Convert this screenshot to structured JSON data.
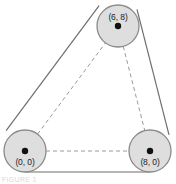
{
  "figure": {
    "name": "three-pulley-belt-diagram",
    "background_color": "#ffffff",
    "width": 176,
    "height": 184,
    "circle_fill": "#dedede",
    "circle_stroke": "#8a8a8a",
    "belt_color": "#6e6e6e",
    "dashed_color": "#9a9a9a",
    "dot_color": "#111111"
  },
  "pulleys": [
    {
      "id": "top",
      "label": "(6, 8)",
      "cx": 118,
      "cy": 26,
      "r": 21,
      "label_dx": 0,
      "label_dy": -6
    },
    {
      "id": "bottom-left",
      "label": "(0, 0)",
      "cx": 25,
      "cy": 151,
      "r": 21,
      "label_dx": 0,
      "label_dy": 14
    },
    {
      "id": "bottom-right",
      "label": "(8, 0)",
      "cx": 150,
      "cy": 151,
      "r": 21,
      "label_dx": 0,
      "label_dy": 14
    }
  ],
  "belt_segments": [
    {
      "id": "left-belt",
      "x1": 6.1,
      "y1": 130.6,
      "x2": 99.1,
      "y2": 5.6
    },
    {
      "id": "right-belt",
      "x1": 137.0,
      "y1": 9.3,
      "x2": 169.0,
      "y2": 134.9
    },
    {
      "id": "bottom-belt",
      "x1": 25.0,
      "y1": 172.0,
      "x2": 150.0,
      "y2": 172.0
    }
  ],
  "center_links": [
    {
      "id": "left-to-top",
      "x1": 25,
      "y1": 151,
      "x2": 118,
      "y2": 26
    },
    {
      "id": "top-to-right",
      "x1": 118,
      "y1": 26,
      "x2": 150,
      "y2": 151
    },
    {
      "id": "left-to-right",
      "x1": 25,
      "y1": 151,
      "x2": 150,
      "y2": 151
    }
  ],
  "caption": {
    "text": "FIGURE 1"
  }
}
